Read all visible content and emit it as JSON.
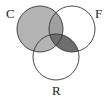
{
  "diagram": {
    "type": "venn",
    "sets": [
      {
        "id": "C",
        "label": "C",
        "cx": 40,
        "cy": 29,
        "r": 23
      },
      {
        "id": "F",
        "label": "F",
        "cx": 72,
        "cy": 29,
        "r": 23
      },
      {
        "id": "R",
        "label": "R",
        "cx": 56,
        "cy": 57,
        "r": 23
      }
    ],
    "shading": {
      "C_only": "#b4b4b4",
      "C_and_F": "#a0a0a0",
      "F_and_R": "#6e6e6e",
      "C_and_F_and_R": "#6e6e6e"
    },
    "colors": {
      "stroke": "#333333",
      "background": "#ffffff"
    }
  }
}
